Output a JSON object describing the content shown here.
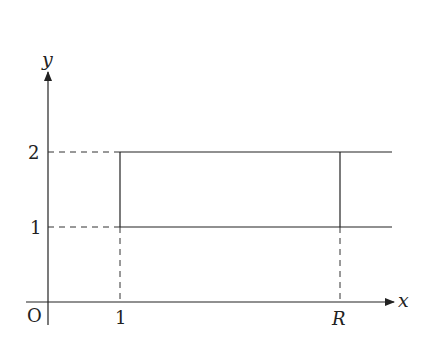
{
  "diagram": {
    "type": "coordinate-region",
    "axes": {
      "x_label": "x",
      "y_label": "y",
      "origin_label": "O"
    },
    "ticks": {
      "x": [
        "1",
        "R"
      ],
      "y": [
        "1",
        "2"
      ]
    },
    "region": {
      "x_start": "1",
      "x_mark": "R",
      "y_bottom": "1",
      "y_top": "2",
      "extends_right": true
    },
    "colors": {
      "line": "#222222",
      "background": "#ffffff"
    }
  }
}
